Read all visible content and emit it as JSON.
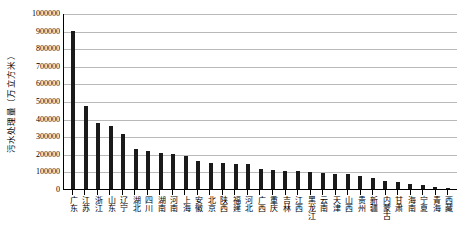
{
  "chart_data": {
    "type": "bar",
    "title": "",
    "xlabel": "",
    "ylabel": "污水处理量（万立方米）",
    "ylim": [
      0,
      1000000
    ],
    "ytick_step": 100000,
    "grid": true,
    "legend": "none",
    "bar_color": "#1a1a1a",
    "gridline_color": "#b9b9b9",
    "yticks": [
      "1000000",
      "900000",
      "800000",
      "700000",
      "600000",
      "500000",
      "400000",
      "300000",
      "200000",
      "100000",
      "0"
    ],
    "categories": [
      "广东",
      "江苏",
      "浙江",
      "山东",
      "辽宁",
      "湖北",
      "四川",
      "湖南",
      "河南",
      "上海",
      "安徽",
      "北京",
      "陕西",
      "福建",
      "河北",
      "广西",
      "重庆",
      "吉林",
      "江西",
      "黑龙江",
      "云南",
      "天津",
      "山西",
      "贵州",
      "新疆",
      "内蒙古",
      "甘肃",
      "海南",
      "宁夏",
      "青海",
      "西藏"
    ],
    "values": [
      900000,
      470000,
      375000,
      358000,
      315000,
      230000,
      215000,
      205000,
      198000,
      190000,
      160000,
      150000,
      148000,
      143000,
      140000,
      112000,
      108000,
      103000,
      100000,
      98000,
      92000,
      88000,
      84000,
      72000,
      62000,
      45000,
      42000,
      26000,
      22000,
      14000,
      6000
    ]
  }
}
